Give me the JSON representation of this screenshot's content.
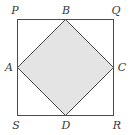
{
  "diagram": {
    "colors": {
      "stroke": "#4a4a4a",
      "fill": "#e4e4e4",
      "label": "#3a3a3a"
    },
    "outer_square": {
      "vertices": [
        "P",
        "Q",
        "R",
        "S"
      ]
    },
    "inner_square": {
      "vertices": [
        "A",
        "B",
        "C",
        "D"
      ],
      "shaded": true
    },
    "labels": {
      "P": "P",
      "Q": "Q",
      "R": "R",
      "S": "S",
      "A": "A",
      "B": "B",
      "C": "C",
      "D": "D"
    }
  }
}
